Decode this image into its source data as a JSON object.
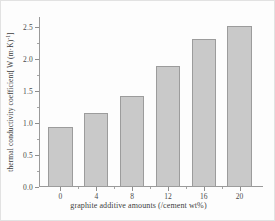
{
  "chart_data": {
    "type": "bar",
    "title": "",
    "subtitle": "",
    "xlabel": "graphite additive amounts (/cement wt%)",
    "ylabel_prefix": "thermal conductivity coefficient[ W (m·K)",
    "ylabel_exponent": "-1",
    "ylabel_suffix": "]",
    "ylabel_full": "thermal conductivity coefficient[ W (m·K)-1]",
    "categories": [
      "0",
      "4",
      "8",
      "12",
      "16",
      "20"
    ],
    "values": [
      0.93,
      1.15,
      1.42,
      1.88,
      2.31,
      2.51
    ],
    "x": [
      0,
      4,
      8,
      12,
      16,
      20
    ],
    "xlim": [
      -2.4,
      22.4
    ],
    "ylim": [
      0.0,
      2.65
    ],
    "y_major_ticks": [
      "0.0",
      "0.5",
      "1.0",
      "1.5",
      "2.0",
      "2.5"
    ],
    "y_major_values": [
      0.0,
      0.5,
      1.0,
      1.5,
      2.0,
      2.5
    ],
    "y_minor_values": [
      0.25,
      0.75,
      1.25,
      1.75,
      2.25
    ],
    "x_major_values": [
      0,
      4,
      8,
      12,
      16,
      20
    ],
    "x_minor_values": [
      2,
      6,
      10,
      14,
      18
    ],
    "grid": false,
    "legend": null,
    "legend_position": "none",
    "bar_fill_color": "#c9c9c9",
    "bar_edge_color": "#9c9c9c",
    "axis_color": "#9a9a9a",
    "text_color": "#3d3d3d",
    "background_color": "#fdfdfd",
    "bar_width_units": 2.7
  }
}
